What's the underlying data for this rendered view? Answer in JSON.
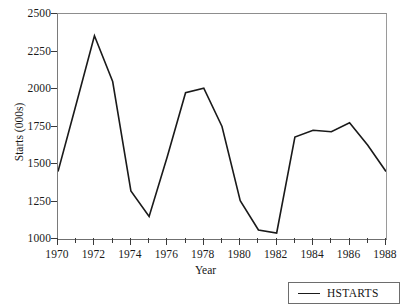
{
  "chart_data": {
    "type": "line",
    "title": "",
    "xlabel": "Year",
    "ylabel": "Starts (000s)",
    "xlim": [
      1970,
      1988
    ],
    "ylim": [
      1000,
      2500
    ],
    "grid": false,
    "legend_position": "bottom-right",
    "x_tick_labels": [
      "1970",
      "1972",
      "1974",
      "1976",
      "1978",
      "1980",
      "1982",
      "1984",
      "1986",
      "1988"
    ],
    "x_major_ticks": [
      1970,
      1972,
      1974,
      1976,
      1978,
      1980,
      1982,
      1984,
      1986,
      1988
    ],
    "x_minor_ticks": [
      1971,
      1973,
      1975,
      1977,
      1979,
      1981,
      1983,
      1985,
      1987
    ],
    "y_tick_labels": [
      "1000",
      "1250",
      "1500",
      "1750",
      "2000",
      "2250",
      "2500"
    ],
    "y_ticks": [
      1000,
      1250,
      1500,
      1750,
      2000,
      2250,
      2500
    ],
    "x": [
      1970,
      1971,
      1972,
      1973,
      1974,
      1975,
      1976,
      1977,
      1978,
      1979,
      1980,
      1981,
      1982,
      1983,
      1984,
      1985,
      1986,
      1987,
      1988
    ],
    "series": [
      {
        "name": "HSTARTS",
        "color": "#1a1a1a",
        "line_width": 1.6,
        "values": [
          1450,
          1900,
          2355,
          2050,
          1320,
          1150,
          1550,
          1975,
          2005,
          1750,
          1255,
          1060,
          1040,
          1680,
          1725,
          1715,
          1775,
          1625,
          1450
        ]
      }
    ]
  },
  "legend": {
    "entries": [
      {
        "label": "HSTARTS"
      }
    ]
  },
  "axes": {
    "y_title": "Starts (000s)",
    "x_title": "Year"
  }
}
